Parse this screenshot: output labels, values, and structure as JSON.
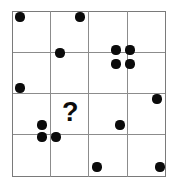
{
  "puzzle": {
    "title": "Dot Grid Puzzle",
    "question_mark": "?",
    "question_mark_position": {
      "x": 62,
      "y": 99
    },
    "question_mark_font_size": 27,
    "canvas": {
      "width": 175,
      "height": 183,
      "background": "#ffffff"
    },
    "grid": {
      "rows": 4,
      "columns": 4,
      "left": 12,
      "top": 11,
      "right": 165,
      "bottom": 176,
      "cell_width": 38.25,
      "cell_height": 41.25,
      "line_color": "#8c8c8c",
      "border_color": "#7a7a7a",
      "vertical_line_x": [
        12,
        50,
        88,
        127,
        165
      ],
      "horizontal_line_y": [
        11,
        52,
        93,
        134,
        176
      ]
    },
    "dot_style": {
      "color": "#0b0b0b",
      "diameter": 9
    },
    "dots": [
      {
        "id": "dot-r1c1",
        "cx": 20,
        "cy": 17,
        "r": 4.6,
        "cell": "row1-col1"
      },
      {
        "id": "dot-r1c2",
        "cx": 80,
        "cy": 17,
        "r": 4.6,
        "cell": "row1-col2"
      },
      {
        "id": "dot-r2c2",
        "cx": 60,
        "cy": 53,
        "r": 4.6,
        "cell": "row2-col2"
      },
      {
        "id": "dot-cluster-tl",
        "cx": 116,
        "cy": 50,
        "r": 4.6,
        "cell": "row1-col3"
      },
      {
        "id": "dot-cluster-tr",
        "cx": 130,
        "cy": 50,
        "r": 4.6,
        "cell": "row1-col4"
      },
      {
        "id": "dot-cluster-bl",
        "cx": 116,
        "cy": 64,
        "r": 4.6,
        "cell": "row2-col3"
      },
      {
        "id": "dot-cluster-br",
        "cx": 130,
        "cy": 64,
        "r": 4.6,
        "cell": "row2-col4"
      },
      {
        "id": "dot-r2c1",
        "cx": 20,
        "cy": 88,
        "r": 4.6,
        "cell": "row2-col1"
      },
      {
        "id": "dot-r3c4",
        "cx": 157,
        "cy": 99,
        "r": 4.6,
        "cell": "row3-col4"
      },
      {
        "id": "dot-r3c2",
        "cx": 42,
        "cy": 125,
        "r": 4.6,
        "cell": "row3-col2"
      },
      {
        "id": "dot-r3c3",
        "cx": 120,
        "cy": 125,
        "r": 4.6,
        "cell": "row3-col3"
      },
      {
        "id": "dot-r4c2a",
        "cx": 42,
        "cy": 137,
        "r": 4.6,
        "cell": "row4-col1"
      },
      {
        "id": "dot-r4c2b",
        "cx": 56,
        "cy": 137,
        "r": 4.6,
        "cell": "row4-col2"
      },
      {
        "id": "dot-r4c3",
        "cx": 97,
        "cy": 167,
        "r": 4.6,
        "cell": "row4-col3"
      },
      {
        "id": "dot-r4c4",
        "cx": 160,
        "cy": 167,
        "r": 4.6,
        "cell": "row4-col4"
      }
    ]
  }
}
